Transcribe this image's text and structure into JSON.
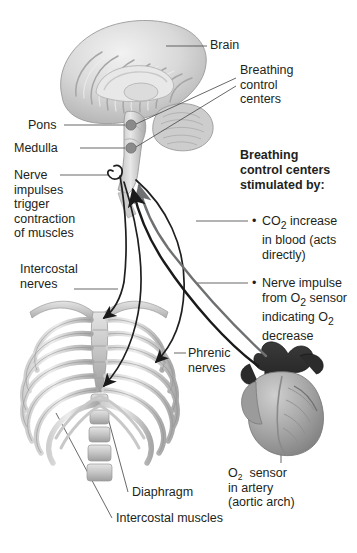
{
  "figure": {
    "background_color": "#ffffff",
    "text_color": "#231f20"
  },
  "labels": {
    "brain": "Brain",
    "breathing_control_centers": "Breathing\ncontrol\ncenters",
    "pons": "Pons",
    "medulla": "Medulla",
    "nerve_impulses": "Nerve\nimpulses\ntrigger\ncontraction\nof muscles",
    "intercostal_nerves": "Intercostal\nnerves",
    "phrenic_nerves": "Phrenic\nnerves",
    "diaphragm": "Diaphragm",
    "intercostal_muscles": "Intercostal muscles"
  },
  "panel": {
    "heading": "Breathing\ncontrol centers\nstimulated by:",
    "heading_line1": "Breathing",
    "heading_line2": "control centers",
    "heading_line3": "stimulated by:",
    "bullet_glyph": "•",
    "bullets": [
      {
        "id": "co2-increase",
        "line1_pre": "CO",
        "line1_sub": "2",
        "line1_post": " increase",
        "rest": "in blood (acts\ndirectly)"
      },
      {
        "id": "nerve-impulse-o2",
        "line1": "Nerve impulse",
        "line2_pre": "from O",
        "line2_sub": "2",
        "line2_post": "  sensor",
        "line3_pre": "indicating O",
        "line3_sub": "2",
        "line4": "decrease"
      }
    ]
  },
  "o2_sensor": {
    "line1_pre": "O",
    "line1_sub": "2",
    "line1_post": "  sensor",
    "line2": "in artery",
    "line3": "(aortic arch)"
  },
  "colors": {
    "ink": "#231f20",
    "leader_line": "#4d4d4d",
    "arrow_gray": "#6e7072",
    "arrow_black": "#1a1a1a",
    "anatomy_light": "#d8d8d8",
    "anatomy_mid": "#b0b0b0",
    "anatomy_dark": "#7f7f7f",
    "aorta_dark": "#2b2b2b",
    "marker_dot": "#8a8a8a"
  },
  "icons": {
    "pons_marker": "circle-marker-icon",
    "medulla_marker": "circle-marker-icon",
    "nerve_loop": "nerve-loop-icon"
  }
}
